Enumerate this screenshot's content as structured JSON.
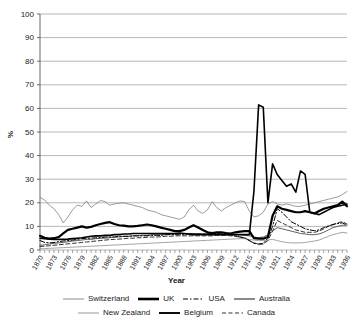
{
  "chart_data": {
    "type": "line",
    "title": "",
    "xlabel": "Year",
    "ylabel": "%",
    "ylim": [
      0,
      100
    ],
    "ytick_step": 10,
    "yticks": [
      0,
      10,
      20,
      30,
      40,
      50,
      60,
      70,
      80,
      90,
      100
    ],
    "xlim": [
      1870,
      1936
    ],
    "xtick_labels": [
      "1870",
      "1873",
      "1876",
      "1879",
      "1882",
      "1885",
      "1888",
      "1891",
      "1894",
      "1897",
      "1900",
      "1903",
      "1906",
      "1909",
      "1912",
      "1915",
      "1918",
      "1921",
      "1924",
      "1927",
      "1930",
      "1933",
      "1936"
    ],
    "xtick_label_step": 3,
    "minor_ticks_every_year": true,
    "grid": "horizontal",
    "legend_position": "bottom",
    "x": [
      1870,
      1871,
      1872,
      1873,
      1874,
      1875,
      1876,
      1877,
      1878,
      1879,
      1880,
      1881,
      1882,
      1883,
      1884,
      1885,
      1886,
      1887,
      1888,
      1889,
      1890,
      1891,
      1892,
      1893,
      1894,
      1895,
      1896,
      1897,
      1898,
      1899,
      1900,
      1901,
      1902,
      1903,
      1904,
      1905,
      1906,
      1907,
      1908,
      1909,
      1910,
      1911,
      1912,
      1913,
      1914,
      1915,
      1916,
      1917,
      1918,
      1919,
      1920,
      1921,
      1922,
      1923,
      1924,
      1925,
      1926,
      1927,
      1928,
      1929,
      1930,
      1931,
      1932,
      1933,
      1934,
      1935,
      1936
    ],
    "series": [
      {
        "name": "Switzerland",
        "style": "thin-solid",
        "color": "#808080",
        "width": 0.8,
        "dash": "none",
        "values": [
          22.3,
          21.2,
          19.0,
          17.5,
          15.0,
          11.5,
          14.0,
          17.0,
          19.0,
          18.5,
          20.8,
          18.0,
          19.5,
          21.0,
          20.5,
          19.0,
          19.5,
          19.8,
          20.0,
          19.5,
          19.0,
          18.5,
          18.0,
          17.0,
          16.5,
          16.0,
          15.0,
          14.5,
          14.0,
          13.5,
          13.0,
          14.0,
          17.0,
          19.0,
          16.5,
          15.5,
          17.0,
          20.5,
          18.0,
          16.5,
          18.0,
          19.0,
          20.0,
          20.8,
          20.5,
          16.5,
          14.0,
          14.5,
          16.0,
          19.5,
          20.5,
          19.5,
          19.0,
          19.5,
          19.0,
          18.5,
          18.5,
          19.0,
          19.5,
          20.0,
          20.5,
          21.0,
          21.5,
          22.0,
          22.5,
          23.5,
          24.8
        ]
      },
      {
        "name": "UK",
        "style": "thick-solid",
        "color": "#000000",
        "width": 2.2,
        "dash": "none",
        "values": [
          6.0,
          5.2,
          4.8,
          5.0,
          5.5,
          7.0,
          8.5,
          9.0,
          9.5,
          10.0,
          9.5,
          9.8,
          10.5,
          11.0,
          11.5,
          11.8,
          11.0,
          10.5,
          10.3,
          10.0,
          10.0,
          10.2,
          10.5,
          10.8,
          10.5,
          10.0,
          9.5,
          9.0,
          8.5,
          8.0,
          8.0,
          8.5,
          9.5,
          10.5,
          9.5,
          8.5,
          7.5,
          7.2,
          7.5,
          7.5,
          7.2,
          7.0,
          7.5,
          7.8,
          8.0,
          8.0,
          5.0,
          4.8,
          4.8,
          5.5,
          14.5,
          18.5,
          17.5,
          17.0,
          16.5,
          16.0,
          16.0,
          16.5,
          16.0,
          15.5,
          16.5,
          17.5,
          18.0,
          18.5,
          19.0,
          20.5,
          18.5
        ]
      },
      {
        "name": "USA",
        "style": "dash-dot",
        "color": "#000000",
        "width": 1.0,
        "dash": "5,2,1.5,2",
        "values": [
          4.0,
          3.2,
          3.0,
          3.2,
          3.5,
          3.8,
          4.0,
          4.2,
          4.5,
          4.8,
          5.0,
          5.0,
          5.2,
          5.2,
          5.5,
          5.5,
          5.5,
          5.8,
          5.8,
          5.8,
          6.0,
          6.0,
          6.0,
          6.0,
          6.2,
          6.2,
          6.2,
          6.5,
          6.5,
          6.5,
          6.5,
          6.5,
          6.8,
          6.8,
          6.8,
          6.8,
          6.8,
          7.0,
          7.0,
          6.8,
          6.8,
          6.5,
          6.0,
          5.5,
          5.2,
          4.0,
          2.8,
          2.5,
          2.8,
          5.0,
          10.0,
          17.5,
          16.0,
          14.0,
          12.0,
          11.0,
          10.0,
          9.0,
          8.5,
          8.2,
          8.5,
          9.5,
          10.2,
          10.8,
          11.2,
          11.5,
          10.5
        ]
      },
      {
        "name": "Australia",
        "style": "thin-solid",
        "color": "#4d4d4d",
        "width": 0.9,
        "dash": "none",
        "values": [
          2.0,
          2.2,
          2.5,
          2.8,
          3.0,
          3.2,
          3.5,
          3.8,
          4.0,
          4.2,
          4.5,
          4.5,
          4.8,
          5.0,
          5.0,
          5.2,
          5.5,
          5.5,
          5.8,
          5.8,
          6.0,
          6.0,
          6.2,
          6.2,
          6.5,
          6.5,
          6.5,
          6.5,
          6.8,
          6.8,
          7.0,
          7.0,
          7.0,
          7.0,
          6.8,
          6.8,
          6.8,
          6.8,
          6.8,
          6.5,
          6.5,
          6.5,
          6.5,
          6.5,
          6.2,
          6.0,
          5.5,
          5.2,
          5.5,
          6.5,
          8.0,
          9.5,
          9.0,
          8.5,
          8.0,
          7.5,
          7.0,
          6.8,
          6.5,
          6.5,
          6.8,
          7.5,
          8.5,
          9.5,
          10.0,
          10.5,
          10.5
        ]
      },
      {
        "name": "New Zealand",
        "style": "thin-solid",
        "color": "#8c8c8c",
        "width": 0.8,
        "dash": "none",
        "values": [
          0.5,
          0.6,
          0.7,
          0.8,
          0.9,
          1.0,
          1.1,
          1.2,
          1.3,
          1.4,
          1.5,
          1.6,
          1.7,
          1.8,
          1.9,
          2.0,
          2.1,
          2.2,
          2.3,
          2.4,
          2.5,
          2.6,
          2.7,
          2.8,
          2.9,
          3.0,
          3.1,
          3.2,
          3.3,
          3.4,
          3.5,
          3.6,
          3.7,
          3.8,
          3.9,
          4.0,
          4.1,
          4.2,
          4.3,
          4.4,
          4.5,
          4.6,
          4.7,
          4.8,
          4.8,
          4.5,
          4.2,
          4.0,
          4.0,
          4.2,
          4.5,
          4.0,
          3.5,
          3.2,
          3.0,
          3.0,
          3.0,
          3.2,
          3.5,
          3.8,
          4.2,
          5.0,
          5.8,
          6.5,
          7.0,
          7.5,
          7.2
        ]
      },
      {
        "name": "Belgium",
        "style": "medium-solid",
        "color": "#000000",
        "width": 1.6,
        "dash": "none",
        "values": [
          5.0,
          4.8,
          4.6,
          4.5,
          4.5,
          4.5,
          4.6,
          4.8,
          5.0,
          5.2,
          5.5,
          5.8,
          6.0,
          6.0,
          6.2,
          6.2,
          6.5,
          6.5,
          6.8,
          6.8,
          7.0,
          7.0,
          7.0,
          7.0,
          7.0,
          7.0,
          7.0,
          7.0,
          7.0,
          7.0,
          7.2,
          7.0,
          6.8,
          6.5,
          6.5,
          6.5,
          6.5,
          6.5,
          6.5,
          6.5,
          6.5,
          6.5,
          6.5,
          6.5,
          6.5,
          6.5,
          25.0,
          61.5,
          60.5,
          20.0,
          36.5,
          32.0,
          29.5,
          27.0,
          28.0,
          24.5,
          33.5,
          32.0,
          16.0,
          15.5,
          15.0,
          16.0,
          17.0,
          18.0,
          18.5,
          19.0,
          19.5
        ]
      },
      {
        "name": "Canada",
        "style": "dashed",
        "color": "#333333",
        "width": 1.0,
        "dash": "4,2.5",
        "values": [
          1.5,
          1.6,
          1.8,
          2.0,
          2.2,
          2.4,
          2.6,
          2.8,
          3.0,
          3.2,
          3.4,
          3.6,
          3.8,
          4.0,
          4.2,
          4.4,
          4.5,
          4.6,
          4.8,
          5.0,
          5.0,
          5.2,
          5.2,
          5.4,
          5.5,
          5.5,
          5.6,
          5.8,
          5.8,
          6.0,
          6.0,
          6.0,
          6.0,
          6.0,
          6.0,
          6.0,
          6.0,
          6.0,
          6.2,
          6.2,
          6.2,
          6.0,
          5.8,
          5.5,
          5.0,
          4.0,
          3.0,
          2.5,
          2.5,
          4.0,
          8.0,
          12.5,
          11.5,
          10.5,
          9.5,
          8.5,
          8.0,
          7.5,
          7.5,
          7.5,
          8.0,
          9.0,
          10.0,
          10.8,
          11.5,
          12.0,
          11.0
        ]
      }
    ]
  },
  "legend": {
    "rows": [
      [
        {
          "label": "Switzerland",
          "key": "thin-solid-gray"
        },
        {
          "label": "UK",
          "key": "thick-solid-black"
        },
        {
          "label": "USA",
          "key": "dash-dot-black"
        },
        {
          "label": "Australia",
          "key": "thin-solid-dark"
        }
      ],
      [
        {
          "label": "New Zealand",
          "key": "thin-solid-gray"
        },
        {
          "label": "Belgium",
          "key": "medium-solid-black"
        },
        {
          "label": "Canada",
          "key": "dashed-black"
        }
      ]
    ]
  },
  "axes": {
    "x_title": "Year",
    "y_title": "%"
  }
}
